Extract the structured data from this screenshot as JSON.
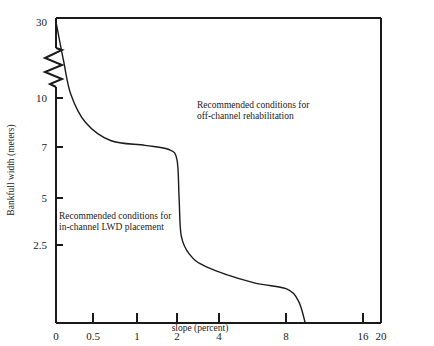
{
  "chart_data": {
    "type": "line",
    "title": "",
    "xlabel": "slope (percent)",
    "ylabel": "Bankfull width (meters)",
    "x_scale": "nonlinear (labeled tick positions)",
    "y_scale": "nonlinear (labeled tick positions, axis break between 10 and 30)",
    "xlim": [
      0,
      20
    ],
    "ylim": [
      0,
      30
    ],
    "x_ticks": [
      {
        "label": "0",
        "value": 0
      },
      {
        "label": "0.5",
        "value": 0.5
      },
      {
        "label": "1",
        "value": 1
      },
      {
        "label": "2",
        "value": 2
      },
      {
        "label": "4",
        "value": 4
      },
      {
        "label": "8",
        "value": 8
      },
      {
        "label": "16",
        "value": 16
      },
      {
        "label": "20",
        "value": 20
      }
    ],
    "y_ticks": [
      {
        "label": "2.5",
        "value": 2.5
      },
      {
        "label": "5",
        "value": 5
      },
      {
        "label": "7",
        "value": 7
      },
      {
        "label": "10",
        "value": 10
      },
      {
        "label": "30",
        "value": 30
      }
    ],
    "axis_break": {
      "axis": "y",
      "between": [
        10,
        30
      ]
    },
    "grid": false,
    "legend": "none",
    "series": [
      {
        "name": "boundary between in-channel and off-channel recommendations",
        "points": [
          {
            "x": 0,
            "y": 30
          },
          {
            "x": 0.1,
            "y": 20
          },
          {
            "x": 0.2,
            "y": 11
          },
          {
            "x": 0.4,
            "y": 8.5
          },
          {
            "x": 0.7,
            "y": 7.4
          },
          {
            "x": 1.2,
            "y": 7.1
          },
          {
            "x": 1.8,
            "y": 6.9
          },
          {
            "x": 2.0,
            "y": 6.5
          },
          {
            "x": 2.1,
            "y": 5.0
          },
          {
            "x": 2.2,
            "y": 3.0
          },
          {
            "x": 2.6,
            "y": 2.2
          },
          {
            "x": 3.4,
            "y": 1.8
          },
          {
            "x": 6,
            "y": 1.3
          },
          {
            "x": 8,
            "y": 1.1
          },
          {
            "x": 9.3,
            "y": 0.7
          },
          {
            "x": 10,
            "y": 0
          }
        ]
      }
    ],
    "annotations": [
      {
        "id": "off_channel",
        "text_lines": [
          "Recommended conditions for",
          "off-channel rehabilitation"
        ],
        "region": "upper-right"
      },
      {
        "id": "in_channel",
        "text_lines": [
          "Recommended conditions for",
          "in-channel LWD placement"
        ],
        "region": "lower-left"
      }
    ]
  }
}
